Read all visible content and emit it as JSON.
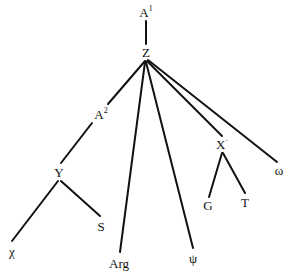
{
  "diagram": {
    "type": "tree",
    "nodes": {
      "a1": {
        "label": "A",
        "sup": "1"
      },
      "z": {
        "label": "Z"
      },
      "a2": {
        "label": "A",
        "sup": "2"
      },
      "y": {
        "label": "Y"
      },
      "chi": {
        "label": "χ"
      },
      "s": {
        "label": "S"
      },
      "arg": {
        "label": "Arg"
      },
      "psi": {
        "label": "ψ"
      },
      "x": {
        "label": "X",
        "sup": "·"
      },
      "g": {
        "label": "G"
      },
      "t": {
        "label": "T"
      },
      "omega": {
        "label": "ω"
      }
    },
    "edges": [
      [
        "a1",
        "z"
      ],
      [
        "z",
        "a2"
      ],
      [
        "a2",
        "y"
      ],
      [
        "y",
        "chi"
      ],
      [
        "y",
        "s"
      ],
      [
        "z",
        "arg"
      ],
      [
        "z",
        "psi"
      ],
      [
        "z",
        "x"
      ],
      [
        "x",
        "g"
      ],
      [
        "x",
        "t"
      ],
      [
        "z",
        "omega"
      ]
    ]
  }
}
